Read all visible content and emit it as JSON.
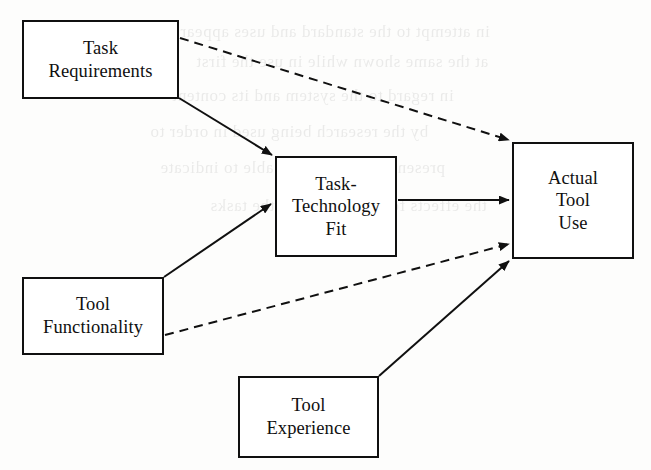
{
  "figure": {
    "type": "conceptual-model-diagram",
    "background_artifact": "faint mirrored bleed-through text from reverse page"
  },
  "nodes": [
    {
      "id": "task-requirements",
      "label": "Task\nRequirements",
      "lines": [
        "Task",
        "Requirements"
      ],
      "x": 22,
      "y": 20,
      "width": 157,
      "height": 79
    },
    {
      "id": "task-technology-fit",
      "label": "Task-\nTechnology\nFit",
      "lines": [
        "Task-",
        "Technology",
        "Fit"
      ],
      "x": 275,
      "y": 156,
      "width": 122,
      "height": 101
    },
    {
      "id": "actual-tool-use",
      "label": "Actual\nTool\nUse",
      "lines": [
        "Actual",
        "Tool",
        "Use"
      ],
      "x": 512,
      "y": 142,
      "width": 122,
      "height": 117
    },
    {
      "id": "tool-functionality",
      "label": "Tool\nFunctionality",
      "lines": [
        "Tool",
        "Functionality"
      ],
      "x": 22,
      "y": 277,
      "width": 142,
      "height": 78
    },
    {
      "id": "tool-experience",
      "label": "Tool\nExperience",
      "lines": [
        "Tool",
        "Experience"
      ],
      "x": 238,
      "y": 376,
      "width": 141,
      "height": 82
    }
  ],
  "edges": [
    {
      "id": "task-requirements-to-task-technology-fit",
      "from": "task-requirements",
      "to": "task-technology-fit",
      "style": "solid",
      "arrow": "single",
      "x1": 179,
      "y1": 98,
      "x2": 272,
      "y2": 155
    },
    {
      "id": "task-requirements-to-actual-tool-use",
      "from": "task-requirements",
      "to": "actual-tool-use",
      "style": "dashed",
      "arrow": "single",
      "x1": 180,
      "y1": 38,
      "x2": 509,
      "y2": 140
    },
    {
      "id": "tool-functionality-to-task-technology-fit",
      "from": "tool-functionality",
      "to": "task-technology-fit",
      "style": "solid",
      "arrow": "single",
      "x1": 164,
      "y1": 277,
      "x2": 271,
      "y2": 204
    },
    {
      "id": "tool-functionality-to-actual-tool-use",
      "from": "tool-functionality",
      "to": "actual-tool-use",
      "style": "dashed",
      "arrow": "single",
      "x1": 165,
      "y1": 335,
      "x2": 509,
      "y2": 244
    },
    {
      "id": "task-technology-fit-to-actual-tool-use",
      "from": "task-technology-fit",
      "to": "actual-tool-use",
      "style": "solid",
      "arrow": "single",
      "x1": 398,
      "y1": 200,
      "x2": 509,
      "y2": 200
    },
    {
      "id": "tool-experience-to-actual-tool-use",
      "from": "tool-experience",
      "to": "actual-tool-use",
      "style": "solid",
      "arrow": "single",
      "x1": 379,
      "y1": 376,
      "x2": 509,
      "y2": 261
    }
  ],
  "colors": {
    "stroke": "#101010",
    "box_fill": "#ffffff",
    "page": "#fdfdfc",
    "text": "#101010"
  },
  "bleed_text": {
    "note": "illegible mirrored show-through, rendered as faint texture",
    "lines": [
      "in attempt to the standard and uses appear",
      "at the same shown while in use the first",
      "in regard to the system and its content",
      "by the research being used in order to",
      "present a model that is able to indicate",
      "the effects for a given set of the tasks"
    ]
  }
}
